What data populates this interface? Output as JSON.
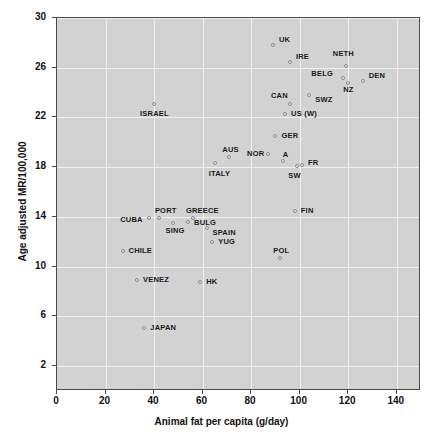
{
  "chart_data": {
    "type": "scatter",
    "title": "",
    "xlabel": "Animal fat per capita (g/day)",
    "ylabel": "Age adjusted MR/100,000",
    "xlim": [
      0,
      150
    ],
    "ylim": [
      0,
      30
    ],
    "xticks": [
      0,
      20,
      40,
      60,
      80,
      100,
      120,
      140
    ],
    "yticks": [
      2,
      6,
      10,
      14,
      18,
      22,
      26,
      30
    ],
    "grid": true,
    "legend": "none",
    "points": [
      {
        "label": "UK",
        "x": 89,
        "y": 27.8,
        "lx": 6,
        "ly": -9
      },
      {
        "label": "IRE",
        "x": 96,
        "y": 26.5,
        "lx": 6,
        "ly": -9
      },
      {
        "label": "NETH",
        "x": 119,
        "y": 26.1,
        "lx": -13,
        "ly": -16
      },
      {
        "label": "BELG",
        "x": 118,
        "y": 25.2,
        "lx": -32,
        "ly": -8
      },
      {
        "label": "DEN",
        "x": 126,
        "y": 24.9,
        "lx": 6,
        "ly": -9
      },
      {
        "label": "NZ",
        "x": 120,
        "y": 24.8,
        "lx": -5,
        "ly": 3
      },
      {
        "label": "SWZ",
        "x": 104,
        "y": 23.8,
        "lx": 6,
        "ly": 1
      },
      {
        "label": "CAN",
        "x": 96,
        "y": 23.1,
        "lx": -19,
        "ly": -12
      },
      {
        "label": "US (W)",
        "x": 94,
        "y": 22.3,
        "lx": 6,
        "ly": -4
      },
      {
        "label": "ISRAEL",
        "x": 40,
        "y": 23.1,
        "lx": -14,
        "ly": 6
      },
      {
        "label": "GER",
        "x": 90,
        "y": 20.5,
        "lx": 6,
        "ly": -4
      },
      {
        "label": "NOR",
        "x": 87,
        "y": 19.1,
        "lx": -21,
        "ly": -4
      },
      {
        "label": "A",
        "x": 93,
        "y": 18.5,
        "lx": 0,
        "ly": -10
      },
      {
        "label": "AUS",
        "x": 71,
        "y": 18.8,
        "lx": -7,
        "ly": -11
      },
      {
        "label": "ITALY",
        "x": 65,
        "y": 18.3,
        "lx": -6,
        "ly": 7
      },
      {
        "label": "FR",
        "x": 101,
        "y": 18.2,
        "lx": 6,
        "ly": -6
      },
      {
        "label": "SW",
        "x": 99,
        "y": 18.1,
        "lx": -9,
        "ly": 6
      },
      {
        "label": "FIN",
        "x": 98,
        "y": 14.5,
        "lx": 6,
        "ly": -4
      },
      {
        "label": "PORT",
        "x": 42,
        "y": 13.9,
        "lx": -4,
        "ly": -11
      },
      {
        "label": "GREECE",
        "x": 56,
        "y": 13.9,
        "lx": -7,
        "ly": -11
      },
      {
        "label": "CUBA",
        "x": 38,
        "y": 13.9,
        "lx": -29,
        "ly": -2
      },
      {
        "label": "SING",
        "x": 48,
        "y": 13.5,
        "lx": -8,
        "ly": 4
      },
      {
        "label": "BULG",
        "x": 54,
        "y": 13.6,
        "lx": 6,
        "ly": -3
      },
      {
        "label": "SPAIN",
        "x": 62,
        "y": 13.1,
        "lx": 5,
        "ly": 1
      },
      {
        "label": "YUG",
        "x": 64,
        "y": 12.0,
        "lx": 6,
        "ly": -4
      },
      {
        "label": "CHILE",
        "x": 27,
        "y": 11.3,
        "lx": 6,
        "ly": -4
      },
      {
        "label": "POL",
        "x": 92,
        "y": 10.7,
        "lx": -7,
        "ly": -11
      },
      {
        "label": "VENEZ",
        "x": 33,
        "y": 8.9,
        "lx": 6,
        "ly": -4
      },
      {
        "label": "HK",
        "x": 59,
        "y": 8.8,
        "lx": 6,
        "ly": -4
      },
      {
        "label": "JAPAN",
        "x": 36,
        "y": 5.1,
        "lx": 6,
        "ly": -4
      }
    ]
  },
  "axes": {
    "x_axis_label": "Animal fat per capita (g/day)",
    "y_axis_label": "Age adjusted MR/100,000",
    "x_tick_labels": [
      "0",
      "20",
      "40",
      "60",
      "80",
      "100",
      "120",
      "140"
    ],
    "y_tick_labels": [
      "30",
      "26",
      "22",
      "18",
      "14",
      "10",
      "6",
      "2"
    ]
  },
  "colors": {
    "plot_background": "#d2d2d2",
    "page_background": "#ffffff",
    "gridline": "#f0f0f0",
    "axis": "#4a4a4a",
    "marker_fill": "#e6e6e6",
    "marker_stroke": "#8a8a8a",
    "text": "#111111"
  }
}
